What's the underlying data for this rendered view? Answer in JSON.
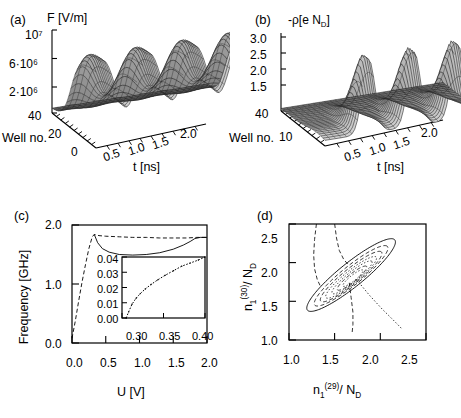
{
  "figure": {
    "panels": [
      "a",
      "b",
      "c",
      "d"
    ],
    "background": "#ffffff",
    "ink": "#000000"
  },
  "panel_a": {
    "tag": "(a)",
    "zlabel": "F [V/m]",
    "zticks": [
      "10⁷",
      "6·10⁶",
      "2·10⁶"
    ],
    "ylabel": "Well no.",
    "yticks": [
      "40",
      "20",
      "0"
    ],
    "xlabel": "t [ns]",
    "xticks": [
      "0",
      "0.5",
      "1.0",
      "1.5",
      "2.0"
    ]
  },
  "panel_b": {
    "tag": "(b)",
    "zlabel_pre": "-ρ[e N",
    "zlabel_sub": "D",
    "zlabel_post": "]",
    "zticks": [
      "3.0",
      "2.5",
      "2.0",
      "1.5"
    ],
    "ylabel": "Well no.",
    "yticks": [
      "40",
      "10"
    ],
    "xlabel": "t [ns]",
    "xticks": [
      "0.5",
      "1.0",
      "1.5",
      "2.0"
    ]
  },
  "panel_c": {
    "tag": "(c)",
    "ylabel": "Frequency [GHz]",
    "xlabel": "U [V]",
    "yticks": [
      "2.0",
      "1.0",
      "0.0"
    ],
    "xticks": [
      "0.0",
      "0.5",
      "1.0",
      "1.5",
      "2.0"
    ],
    "inset": {
      "yticks": [
        "0.04",
        "0.03",
        "0.02",
        "0.01",
        "0.00"
      ],
      "xticks": [
        "0.30",
        "0.35",
        "0.40"
      ]
    }
  },
  "panel_d": {
    "tag": "(d)",
    "ylabel_base": "n",
    "ylabel_sub": "1",
    "ylabel_sup": "(30)",
    "ylabel_tail": "/ N",
    "ylabel_tail_sub": "D",
    "xlabel_base": "n",
    "xlabel_sub": "1",
    "xlabel_sup": "(29)",
    "xlabel_tail": "/ N",
    "xlabel_tail_sub": "D",
    "yticks": [
      "2.5",
      "2.0",
      "1.5",
      "1.0"
    ],
    "xticks": [
      "1.0",
      "1.5",
      "2.0",
      "2.5"
    ]
  },
  "chart_data": [
    {
      "id": "panel_a",
      "type": "heatmap",
      "render": "surface3d",
      "title": "F [V/m]",
      "xlabel": "t [ns]",
      "ylabel": "Well no.",
      "zlabel": "F [V/m]",
      "xlim": [
        0,
        2.0
      ],
      "ylim": [
        0,
        40
      ],
      "zlim": [
        0,
        10000000
      ],
      "ztick_values": [
        10000000,
        6000000,
        2000000
      ],
      "grid": false,
      "legend_position": "none",
      "description": "3D mesh surface of electric field F versus time t and quantum-well number; three travelling-field ridges along time, high plateau at low well numbers falling to a low flat region at high well numbers.",
      "nx": 41,
      "ny": 21,
      "field_peak": 10000000,
      "field_floor": 400000,
      "ridge_times_ns": [
        0.35,
        0.95,
        1.55
      ],
      "ridge_period_ns": 0.6
    },
    {
      "id": "panel_b",
      "type": "heatmap",
      "render": "surface3d",
      "title": "-rho [e N_D]",
      "xlabel": "t [ns]",
      "ylabel": "Well no.",
      "zlabel": "-rho [e N_D]",
      "xlim": [
        0,
        2.0
      ],
      "ylim": [
        10,
        40
      ],
      "zlim": [
        1.0,
        3.2
      ],
      "ztick_values": [
        3.0,
        2.5,
        2.0,
        1.5
      ],
      "grid": false,
      "legend_position": "none",
      "description": "3D mesh surface of charge density -rho versus time t and well number; three tall sharp accumulation-layer peaks reaching about 3.1 e N_D, on a background near 1.0.",
      "nx": 41,
      "ny": 21,
      "peak_value": 3.1,
      "baseline_value": 1.0,
      "peak_times_ns": [
        0.55,
        1.1,
        1.65
      ]
    },
    {
      "id": "panel_c",
      "type": "line",
      "title": "",
      "xlabel": "U [V]",
      "ylabel": "Frequency [GHz]",
      "xlim": [
        0.0,
        2.0
      ],
      "ylim": [
        0.0,
        2.0
      ],
      "xticks": [
        0.0,
        0.5,
        1.0,
        1.5,
        2.0
      ],
      "yticks": [
        0.0,
        1.0,
        2.0
      ],
      "grid": false,
      "legend_position": "none",
      "series": [
        {
          "name": "fundamental frequency (dashed)",
          "style": "dashed",
          "x": [
            0.0,
            0.05,
            0.1,
            0.15,
            0.2,
            0.25,
            0.3,
            0.33,
            0.4,
            0.5,
            0.7,
            0.9,
            1.1,
            1.3,
            1.5,
            1.7,
            1.85,
            2.0
          ],
          "y": [
            0.08,
            0.38,
            0.72,
            1.04,
            1.33,
            1.6,
            1.8,
            1.84,
            1.82,
            1.81,
            1.8,
            1.79,
            1.79,
            1.78,
            1.78,
            1.78,
            1.79,
            1.79
          ]
        },
        {
          "name": "oscillation frequency (solid)",
          "style": "solid",
          "x": [
            0.33,
            0.38,
            0.45,
            0.55,
            0.7,
            0.9,
            1.1,
            1.3,
            1.5,
            1.65,
            1.75,
            1.82,
            1.9,
            2.0
          ],
          "y": [
            1.84,
            1.7,
            1.6,
            1.54,
            1.5,
            1.49,
            1.5,
            1.53,
            1.59,
            1.66,
            1.72,
            1.77,
            1.79,
            1.79
          ]
        }
      ],
      "inset": {
        "type": "line",
        "xlabel": "",
        "ylabel": "",
        "xlim": [
          0.3,
          0.4
        ],
        "ylim": [
          0.0,
          0.04
        ],
        "xticks": [
          0.3,
          0.35,
          0.4
        ],
        "yticks": [
          0.0,
          0.01,
          0.02,
          0.03,
          0.04
        ],
        "grid": false,
        "series": [
          {
            "name": "amplitude near onset",
            "style": "dotted",
            "x": [
              0.305,
              0.308,
              0.312,
              0.317,
              0.322,
              0.328,
              0.335,
              0.343,
              0.352,
              0.362,
              0.372,
              0.382,
              0.392,
              0.4
            ],
            "y": [
              0.0,
              0.004,
              0.009,
              0.013,
              0.016,
              0.019,
              0.022,
              0.025,
              0.028,
              0.031,
              0.034,
              0.036,
              0.038,
              0.04
            ]
          }
        ]
      }
    },
    {
      "id": "panel_d",
      "type": "line",
      "render": "phase-portrait",
      "title": "",
      "xlabel": "n_1^(29) / N_D",
      "ylabel": "n_1^(30) / N_D",
      "xlim": [
        1.0,
        2.5
      ],
      "ylim": [
        1.0,
        2.5
      ],
      "xticks": [
        1.0,
        1.5,
        2.0,
        2.5
      ],
      "yticks": [
        1.0,
        1.5,
        2.0,
        2.5
      ],
      "grid": false,
      "legend_position": "none",
      "description": "Phase-space projection showing nested limit-cycle orbits elongated along the diagonal, a large outer solid orbit, inner dashed/dotted spiralling orbits, plus dashed and dotted separatrix-like branches crossing the figure.",
      "orbits": [
        {
          "name": "outer orbit",
          "style": "solid",
          "cx": 1.68,
          "cy": 1.84,
          "a": 0.66,
          "b": 0.145,
          "angle_deg": 44
        },
        {
          "name": "orbit 2",
          "style": "dashed",
          "cx": 1.68,
          "cy": 1.83,
          "a": 0.55,
          "b": 0.115,
          "angle_deg": 44
        },
        {
          "name": "orbit 3",
          "style": "dashed",
          "cx": 1.68,
          "cy": 1.82,
          "a": 0.46,
          "b": 0.095,
          "angle_deg": 44
        },
        {
          "name": "orbit 4",
          "style": "dotted",
          "cx": 1.68,
          "cy": 1.81,
          "a": 0.38,
          "b": 0.078,
          "angle_deg": 44
        },
        {
          "name": "orbit 5",
          "style": "dotted",
          "cx": 1.69,
          "cy": 1.81,
          "a": 0.3,
          "b": 0.062,
          "angle_deg": 44
        },
        {
          "name": "orbit 6",
          "style": "dashed",
          "cx": 1.69,
          "cy": 1.8,
          "a": 0.22,
          "b": 0.048,
          "angle_deg": 44
        },
        {
          "name": "orbit 7",
          "style": "dotted",
          "cx": 1.7,
          "cy": 1.8,
          "a": 0.15,
          "b": 0.034,
          "angle_deg": 44
        }
      ],
      "branches": [
        {
          "name": "left dashed branch",
          "style": "dashed",
          "x": [
            1.3,
            1.28,
            1.27,
            1.28,
            1.31,
            1.35
          ],
          "y": [
            2.5,
            2.3,
            2.1,
            1.92,
            1.78,
            1.68
          ]
        },
        {
          "name": "upper dashed branch",
          "style": "dashed",
          "x": [
            1.5,
            1.52,
            1.55,
            1.6,
            1.66
          ],
          "y": [
            2.5,
            2.32,
            2.16,
            2.04,
            1.96
          ]
        },
        {
          "name": "lower dashed branch",
          "style": "dashed",
          "x": [
            1.66,
            1.68,
            1.7,
            1.7,
            1.69
          ],
          "y": [
            1.74,
            1.55,
            1.36,
            1.2,
            1.08
          ]
        },
        {
          "name": "right dotted branch",
          "style": "dotted",
          "x": [
            1.74,
            1.88,
            2.02,
            2.14,
            2.24
          ],
          "y": [
            1.78,
            1.58,
            1.4,
            1.26,
            1.14
          ]
        }
      ]
    }
  ]
}
